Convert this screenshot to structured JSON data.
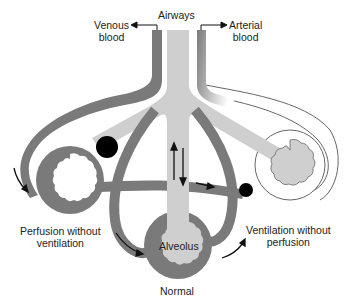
{
  "diagram": {
    "type": "ventilation-perfusion schematic",
    "labels": {
      "airways": "Airways",
      "venous": [
        "Venous",
        "blood"
      ],
      "arterial": [
        "Arterial",
        "blood"
      ],
      "perfusion_without_ventilation": [
        "Perfusion without",
        "ventilation"
      ],
      "ventilation_without_perfusion": [
        "Ventilation without",
        "perfusion"
      ],
      "alveolus": "Alveolus",
      "normal": "Normal"
    },
    "units": [
      {
        "name": "Perfusion without ventilation",
        "airway": "blocked",
        "blood_flow": "present"
      },
      {
        "name": "Normal",
        "airway": "open",
        "blood_flow": "present"
      },
      {
        "name": "Ventilation without perfusion",
        "airway": "open",
        "blood_flow": "blocked"
      }
    ],
    "colors": {
      "vessel": "#7a7a7a",
      "airway": "#cfcfcf",
      "blockage": "#000000",
      "outline": "#555555",
      "background": "#ffffff"
    }
  }
}
